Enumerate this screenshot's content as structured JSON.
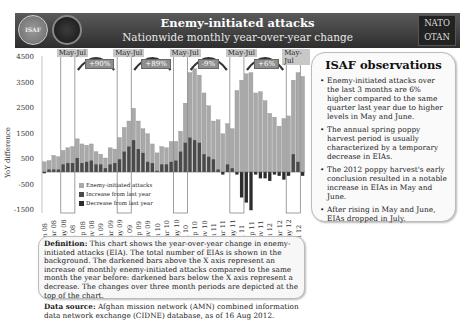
{
  "header": {
    "title": "Enemy-initiated attacks",
    "subtitle": "Nationwide monthly year-over-year change",
    "logo_left": "ISAF",
    "logo_right_top": "NATO",
    "logo_right_bottom": "OTAN"
  },
  "observations": {
    "title": "ISAF observations",
    "items": [
      "Enemy-initiated attacks over the last 3 months are 6% higher compared to the same quarter last year due to higher levels in May and June.",
      "The annual spring poppy harvest period is usually characterized by a temporary decrease in EIAs.",
      "The 2012 poppy harvest's early conclusion resulted in a notable increase in EIAs in May and June.",
      "After rising in May and June, EIAs dropped in July."
    ]
  },
  "definition": {
    "label": "Definition:",
    "text": "This chart shows the year-over-year change in enemy-initiated attacks (EIA). The total number of EIAs is shown in the background. The darkened bars above the X axis represent an increase of monthly enemy-initiated attacks compared to the same month the year before: darkened bars below the X axis represent a decrease. The changes over three month periods are depicted at the top of the chart.",
    "source_label": "Data source:",
    "source_text": "Afghan mission network (AMN) combined information data network exchange (CIDNE) database, as of 16 Aug 2012."
  },
  "chart_data": {
    "type": "bar",
    "title": "Enemy-initiated attacks",
    "subtitle": "Nationwide monthly year-over-year change",
    "ylabel": "YoY difference",
    "xlabel": "",
    "ylim": [
      -1500,
      4500
    ],
    "yticks": [
      4500,
      3500,
      2500,
      1500,
      500,
      -500,
      -1500
    ],
    "xtick_labels": [
      "Jan 08",
      "Mar 08",
      "May 08",
      "Jul 08",
      "Sep 08",
      "Nov 08",
      "Jan 09",
      "Mar 09",
      "May 09",
      "Jul 09",
      "Sep 09",
      "Nov 09",
      "Jan 10",
      "Mar 10",
      "May 10",
      "Jul 10",
      "Sep 10",
      "Nov 10",
      "Jan 11",
      "Mar 11",
      "May 11",
      "Jul 11",
      "Sep 11",
      "Nov 11",
      "Jan 12",
      "Mar 12",
      "May 12",
      "Jul 12"
    ],
    "legend": [
      "Enemy-initiated attacks",
      "Increase from last year",
      "Decrease from last year"
    ],
    "legend_position": "lower-left inside",
    "period_annotations": [
      {
        "label": "May-Jul",
        "change": "+90%"
      },
      {
        "label": "May-Jul",
        "change": "+89%"
      },
      {
        "label": "May-Jul",
        "change": "-9%"
      },
      {
        "label": "May-Jul",
        "change": "+6%"
      },
      {
        "label": "May-Jul",
        "change": ""
      }
    ],
    "months": [
      "Jan 08",
      "Feb 08",
      "Mar 08",
      "Apr 08",
      "May 08",
      "Jun 08",
      "Jul 08",
      "Aug 08",
      "Sep 08",
      "Oct 08",
      "Nov 08",
      "Dec 08",
      "Jan 09",
      "Feb 09",
      "Mar 09",
      "Apr 09",
      "May 09",
      "Jun 09",
      "Jul 09",
      "Aug 09",
      "Sep 09",
      "Oct 09",
      "Nov 09",
      "Dec 09",
      "Jan 10",
      "Feb 10",
      "Mar 10",
      "Apr 10",
      "May 10",
      "Jun 10",
      "Jul 10",
      "Aug 10",
      "Sep 10",
      "Oct 10",
      "Nov 10",
      "Dec 10",
      "Jan 11",
      "Feb 11",
      "Mar 11",
      "Apr 11",
      "May 11",
      "Jun 11",
      "Jul 11",
      "Aug 11",
      "Sep 11",
      "Oct 11",
      "Nov 11",
      "Dec 11",
      "Jan 12",
      "Feb 12",
      "Mar 12",
      "Apr 12",
      "May 12",
      "Jun 12",
      "Jul 12"
    ],
    "series": [
      {
        "name": "Enemy-initiated attacks",
        "values": [
          400,
          450,
          650,
          600,
          850,
          950,
          1000,
          1300,
          1100,
          1050,
          1100,
          800,
          700,
          550,
          950,
          900,
          1350,
          1750,
          2000,
          2500,
          2000,
          1700,
          1500,
          1100,
          750,
          1000,
          950,
          1200,
          1200,
          1600,
          2700,
          3900,
          4050,
          3800,
          3100,
          2600,
          2000,
          2050,
          1500,
          1900,
          1700,
          3200,
          3600,
          3850,
          3900,
          3100,
          3150,
          2800,
          2300,
          2150,
          1800,
          2100,
          2200,
          3600,
          3900,
          3750
        ]
      },
      {
        "name": "YoY change",
        "values": [
          -50,
          100,
          100,
          100,
          300,
          350,
          350,
          550,
          350,
          400,
          450,
          300,
          300,
          150,
          300,
          350,
          500,
          800,
          1000,
          1250,
          900,
          750,
          400,
          350,
          50,
          300,
          300,
          400,
          450,
          800,
          1150,
          1350,
          1250,
          1150,
          700,
          600,
          500,
          100,
          -100,
          300,
          150,
          -100,
          -1000,
          -1200,
          -1500,
          -100,
          -250,
          -250,
          -350,
          -100,
          -150,
          -300,
          -150,
          700,
          400,
          -150
        ]
      }
    ]
  }
}
